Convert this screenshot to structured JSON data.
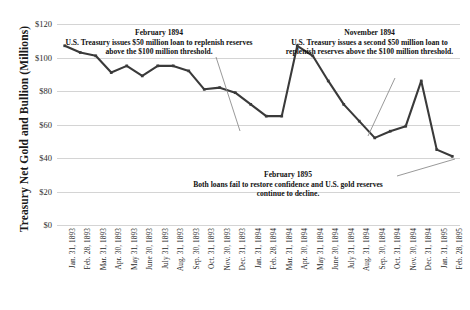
{
  "chart_data": {
    "type": "line",
    "title": "",
    "xlabel": "",
    "ylabel": "Treasury Net Gold and Bullion (Millions)",
    "ylim": [
      0,
      120
    ],
    "ytick_labels": [
      "$120",
      "$100",
      "$80",
      "$60",
      "$40",
      "$20",
      "$0"
    ],
    "ytick_values": [
      120,
      100,
      80,
      60,
      40,
      20,
      0
    ],
    "grid": true,
    "legend": "none",
    "line_color": "#3a3a3a",
    "categories": [
      "Jan. 31, 1893",
      "Feb. 28, 1893",
      "Mar. 31, 1893",
      "Apr. 30, 1893",
      "May 31, 1893",
      "June 30, 1893",
      "July 31, 1893",
      "Aug. 31, 1893",
      "Sep. 30, 1893",
      "Oct. 31, 1893",
      "Nov. 30, 1893",
      "Dec. 31, 1893",
      "Jan. 31, 1894",
      "Feb. 28, 1894",
      "Mar. 31, 1894",
      "Apr. 30, 1894",
      "May 31, 1894",
      "June 30, 1894",
      "July 31, 1894",
      "Aug. 31, 1894",
      "Sep. 30, 1894",
      "Oct. 31, 1894",
      "Nov. 30, 1894",
      "Dec. 31, 1894",
      "Jan. 31, 1895",
      "Feb. 28, 1895"
    ],
    "values": [
      107,
      103,
      101,
      91,
      95,
      89,
      95,
      95,
      92,
      81,
      82,
      79,
      72,
      65,
      65,
      107,
      101,
      86,
      72,
      62,
      52,
      56,
      59,
      86,
      45,
      41
    ],
    "annotations": [
      {
        "id": "feb1894",
        "heading": "February 1894",
        "body": "U.S. Treasury issues $50 million loan to replenish reserves above the $100 million threshold.",
        "points_to": "Feb. 28, 1894"
      },
      {
        "id": "nov1894",
        "heading": "November 1894",
        "body": "U.S. Treasury issues a second $50 million loan to replenish reserves above the $100 million threshold.",
        "points_to": "Nov. 30, 1894"
      },
      {
        "id": "feb1895",
        "heading": "February 1895",
        "body": "Both loans fail to restore confidence and U.S. gold reserves continue to decline.",
        "points_to": "Feb. 28, 1895"
      }
    ]
  }
}
